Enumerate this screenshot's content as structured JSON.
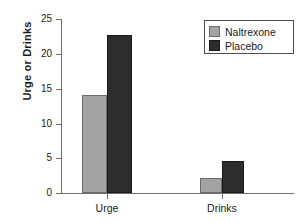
{
  "chart_data": {
    "type": "bar",
    "title": "",
    "subtitle": "",
    "xlabel": "",
    "ylabel": "Urge or Drinks",
    "categories": [
      "Urge",
      "Drinks"
    ],
    "series": [
      {
        "name": "Naltrexone",
        "values": [
          14.1,
          2.1
        ],
        "color": "#a3a3a3"
      },
      {
        "name": "Placebo",
        "values": [
          22.7,
          4.6
        ],
        "color": "#2d2d2d"
      }
    ],
    "ylim": [
      0,
      25
    ],
    "yticks": [
      0,
      5,
      10,
      15,
      20,
      25
    ],
    "ytick_labels": [
      "0",
      "5",
      "10",
      "15",
      "20",
      "25"
    ],
    "grid": false,
    "legend_position": "top-right",
    "annotations": []
  },
  "legend": {
    "entries": [
      {
        "label": "Naltrexone",
        "swatch": "light-gray-swatch"
      },
      {
        "label": "Placebo",
        "swatch": "dark-gray-swatch"
      }
    ]
  },
  "axes": {
    "y_axis_title": "Urge or Drinks",
    "y_tick_0": "0",
    "y_tick_1": "5",
    "y_tick_2": "10",
    "y_tick_3": "15",
    "y_tick_4": "20",
    "y_tick_5": "25",
    "x_cat_0": "Urge",
    "x_cat_1": "Drinks"
  }
}
